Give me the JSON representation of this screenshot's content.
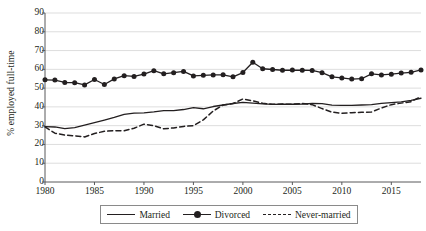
{
  "chart_data": {
    "type": "line",
    "title": "",
    "xlabel": "",
    "ylabel": "% employed full-time",
    "xlim": [
      1980,
      2018
    ],
    "ylim": [
      0,
      90
    ],
    "ytick_step": 10,
    "xtick_step": 5,
    "grid": true,
    "legend_position": "bottom",
    "yticks": [
      0,
      10,
      20,
      30,
      40,
      50,
      60,
      70,
      80,
      90
    ],
    "xticks": [
      1980,
      1985,
      1990,
      1995,
      2000,
      2005,
      2010,
      2015
    ],
    "x": [
      1980,
      1981,
      1982,
      1983,
      1984,
      1985,
      1986,
      1987,
      1988,
      1989,
      1990,
      1991,
      1992,
      1993,
      1994,
      1995,
      1996,
      1997,
      1998,
      1999,
      2000,
      2001,
      2002,
      2003,
      2004,
      2005,
      2006,
      2007,
      2008,
      2009,
      2010,
      2011,
      2012,
      2013,
      2014,
      2015,
      2016,
      2017,
      2018
    ],
    "series": [
      {
        "name": "Married",
        "style": "solid",
        "marker": "none",
        "color": "#231f20",
        "values": [
          29.5,
          29.3,
          28.4,
          29.0,
          30.3,
          31.6,
          33.0,
          34.4,
          36.0,
          36.7,
          36.8,
          37.3,
          38.0,
          38.0,
          38.6,
          39.6,
          39.0,
          40.2,
          41.0,
          41.8,
          42.4,
          42.0,
          41.6,
          41.3,
          41.4,
          41.4,
          41.5,
          41.8,
          41.7,
          40.9,
          40.8,
          40.8,
          41.0,
          41.2,
          41.9,
          42.3,
          42.7,
          43.5,
          44.6
        ]
      },
      {
        "name": "Divorced",
        "style": "solid",
        "marker": "circle",
        "color": "#231f20",
        "values": [
          54.4,
          54.3,
          53.0,
          52.9,
          51.7,
          54.6,
          51.9,
          54.9,
          56.6,
          56.2,
          57.5,
          59.3,
          57.6,
          58.2,
          58.9,
          56.5,
          56.8,
          57.0,
          57.1,
          56.0,
          58.3,
          63.8,
          60.3,
          59.9,
          59.5,
          59.6,
          59.5,
          59.4,
          58.2,
          56.0,
          55.4,
          54.8,
          55.0,
          57.6,
          57.0,
          57.4,
          58.0,
          58.4,
          59.7
        ]
      },
      {
        "name": "Never-married",
        "style": "dashed",
        "marker": "none",
        "color": "#231f20",
        "values": [
          29.3,
          26.0,
          25.0,
          24.6,
          24.0,
          25.8,
          27.0,
          27.3,
          27.3,
          28.6,
          30.8,
          30.0,
          28.3,
          28.8,
          29.6,
          30.0,
          33.1,
          37.8,
          41.0,
          41.8,
          44.2,
          43.2,
          41.9,
          41.4,
          41.5,
          41.4,
          41.8,
          41.2,
          39.1,
          37.2,
          36.6,
          36.9,
          37.1,
          37.3,
          39.4,
          41.2,
          42.0,
          42.8,
          45.5
        ]
      }
    ]
  },
  "legend": {
    "items": [
      {
        "label": "Married"
      },
      {
        "label": "Divorced"
      },
      {
        "label": "Never-married"
      }
    ]
  }
}
